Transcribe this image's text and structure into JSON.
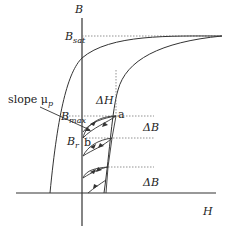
{
  "diagram": {
    "type": "hysteresis-loop",
    "axes": {
      "vertical_label": "B",
      "horizontal_label": "H"
    },
    "labels": {
      "b_sat_main": "B",
      "b_sat_sub": "sat",
      "b_max_main": "B",
      "b_max_sub": "max",
      "b_r_main": "B",
      "b_r_sub": "r",
      "slope_text": "slope μ",
      "slope_sub": "p",
      "delta_h": "ΔH",
      "delta_b_upper": "ΔB",
      "delta_b_lower": "ΔB",
      "point_a": "a",
      "point_b": "b"
    },
    "colors": {
      "line": "#333333",
      "dashed": "#777777",
      "background": "#ffffff"
    }
  }
}
